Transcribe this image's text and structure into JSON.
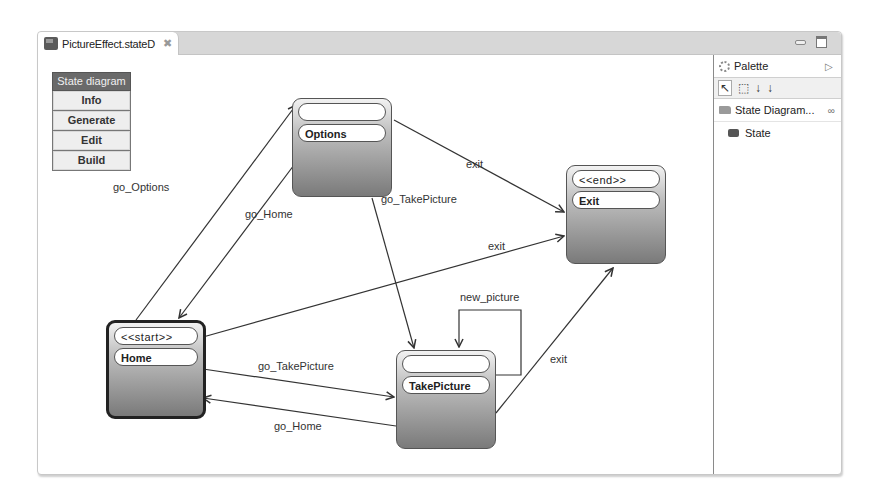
{
  "editor": {
    "tab_title": "PictureEffect.stateD",
    "tab_close_icon": "close-icon",
    "window_buttons": [
      "minimize",
      "maximize"
    ]
  },
  "menu": {
    "title": "State diagram",
    "buttons": [
      "Info",
      "Generate",
      "Edit",
      "Build"
    ]
  },
  "palette": {
    "title": "Palette",
    "tools": [
      "select-tool",
      "marquee-tool",
      "connection-tool",
      "connection-tool-2"
    ],
    "drawer_label": "State Diagram...",
    "items": [
      "State"
    ]
  },
  "diagram": {
    "states": [
      {
        "id": "options",
        "stereotype": "",
        "name": "Options"
      },
      {
        "id": "exit",
        "stereotype": "<<end>>",
        "name": "Exit"
      },
      {
        "id": "home",
        "stereotype": "<<start>>",
        "name": "Home"
      },
      {
        "id": "takepicture",
        "stereotype": "",
        "name": "TakePicture"
      }
    ],
    "transitions": [
      {
        "from": "home",
        "to": "options",
        "label": "go_Options"
      },
      {
        "from": "options",
        "to": "home",
        "label": "go_Home"
      },
      {
        "from": "options",
        "to": "exit",
        "label": "exit"
      },
      {
        "from": "options",
        "to": "takepicture",
        "label": "go_TakePicture"
      },
      {
        "from": "home",
        "to": "exit",
        "label": "exit"
      },
      {
        "from": "takepicture",
        "to": "takepicture",
        "label": "new_picture"
      },
      {
        "from": "takepicture",
        "to": "exit",
        "label": "exit"
      },
      {
        "from": "home",
        "to": "takepicture",
        "label": "go_TakePicture"
      },
      {
        "from": "takepicture",
        "to": "home",
        "label": "go_Home"
      }
    ]
  }
}
